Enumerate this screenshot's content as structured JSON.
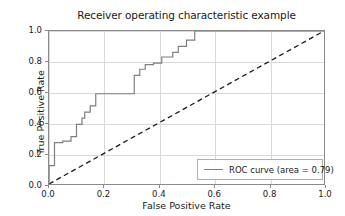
{
  "chart_data": {
    "type": "line",
    "title": "Receiver operating characteristic example",
    "xlabel": "False Positive Rate",
    "ylabel": "True Positive Rate",
    "xlim": [
      0.0,
      1.0
    ],
    "ylim": [
      0.0,
      1.0
    ],
    "xticks": [
      "0.0",
      "0.2",
      "0.4",
      "0.6",
      "0.8",
      "1.0"
    ],
    "xtick_values": [
      0.0,
      0.2,
      0.4,
      0.6,
      0.8,
      1.0
    ],
    "yticks": [
      "0.0",
      "0.2",
      "0.4",
      "0.6",
      "0.8",
      "1.0"
    ],
    "ytick_values": [
      0.0,
      0.2,
      0.4,
      0.6,
      0.8,
      1.0
    ],
    "grid": true,
    "legend_position": "lower right",
    "legend_entries": [
      "ROC curve (area = 0.79)"
    ],
    "auc": 0.79,
    "series": [
      {
        "name": "ROC curve (area = 0.79)",
        "color": "#7f7f7f",
        "style": "step",
        "linestyle": "solid",
        "x": [
          0.0,
          0.0,
          0.02,
          0.02,
          0.05,
          0.05,
          0.08,
          0.08,
          0.1,
          0.1,
          0.12,
          0.12,
          0.13,
          0.13,
          0.15,
          0.15,
          0.17,
          0.17,
          0.31,
          0.31,
          0.33,
          0.33,
          0.35,
          0.35,
          0.38,
          0.38,
          0.41,
          0.41,
          0.45,
          0.45,
          0.47,
          0.47,
          0.5,
          0.5,
          0.53,
          0.53,
          0.57,
          0.57,
          1.0
        ],
        "y": [
          0.0,
          0.12,
          0.12,
          0.27,
          0.27,
          0.28,
          0.28,
          0.31,
          0.31,
          0.39,
          0.39,
          0.43,
          0.43,
          0.47,
          0.47,
          0.51,
          0.51,
          0.59,
          0.59,
          0.71,
          0.71,
          0.75,
          0.75,
          0.78,
          0.78,
          0.79,
          0.79,
          0.83,
          0.83,
          0.86,
          0.86,
          0.9,
          0.9,
          0.94,
          0.94,
          1.0,
          1.0,
          1.0,
          1.0
        ]
      },
      {
        "name": "chance-diagonal",
        "color": "#1a1a1a",
        "style": "line",
        "linestyle": "dashed",
        "x": [
          0.0,
          1.0
        ],
        "y": [
          0.0,
          1.0
        ]
      }
    ]
  },
  "legend": {
    "roc_label": "ROC curve (area = 0.79)"
  }
}
